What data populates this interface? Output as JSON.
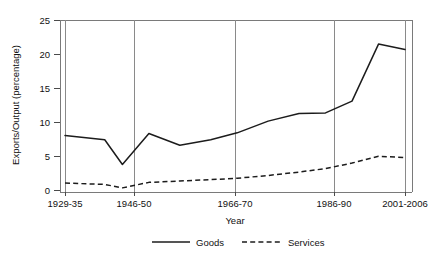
{
  "chart_data": {
    "type": "line",
    "title": "",
    "xlabel": "Year",
    "ylabel": "Exports/Output (percentage)",
    "ylim": [
      0,
      25
    ],
    "yticks": [
      0,
      5,
      10,
      15,
      20,
      25
    ],
    "ytick_labels": [
      "0",
      "5",
      "10",
      "15",
      "20",
      "25"
    ],
    "categories": [
      "1929-35",
      "1946-50",
      "1966-70",
      "1986-90",
      "2001-2006"
    ],
    "xtick_labels": [
      "1929-35",
      "1946-50",
      "1966-70",
      "1986-90",
      "2001-2006"
    ],
    "grid": "vertical-only",
    "legend_position": "bottom-center",
    "series": [
      {
        "name": "Goods",
        "style": "solid",
        "color": "#1c1c1c",
        "x": [
          1929,
          1938,
          1942,
          1948,
          1955,
          1962,
          1968,
          1975,
          1982,
          1988,
          1994,
          2000,
          2006
        ],
        "values": [
          8.2,
          7.6,
          4.0,
          8.5,
          6.8,
          7.6,
          8.6,
          10.3,
          11.4,
          11.5,
          13.2,
          21.5,
          20.7
        ]
      },
      {
        "name": "Services",
        "style": "dashed",
        "color": "#1c1c1c",
        "x": [
          1929,
          1938,
          1942,
          1948,
          1955,
          1962,
          1968,
          1975,
          1982,
          1988,
          1994,
          2000,
          2006
        ],
        "values": [
          1.3,
          1.1,
          0.6,
          1.4,
          1.6,
          1.8,
          2.0,
          2.4,
          2.9,
          3.4,
          4.2,
          5.2,
          5.0
        ]
      }
    ],
    "annotations": []
  },
  "legend": {
    "items": [
      {
        "label": "Goods",
        "style": "solid"
      },
      {
        "label": "Services",
        "style": "dashed"
      }
    ]
  }
}
